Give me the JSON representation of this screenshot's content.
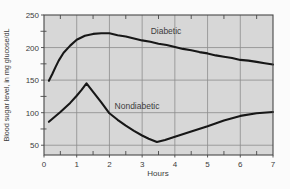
{
  "colors": {
    "outer_bg": "#fbfbfb",
    "plot_bg": "#d7d7d7",
    "grid": "#8d8d8d",
    "axis": "#474747",
    "curve": "#171717",
    "text": "#3c3c3c"
  },
  "chart_data": {
    "type": "line",
    "title": "",
    "xlabel": "Hours",
    "ylabel": "Blood sugar level, in mg glucose/dL",
    "xlim": [
      0,
      7
    ],
    "ylim": [
      35,
      250
    ],
    "x_ticks": [
      0,
      1,
      2,
      3,
      4,
      5,
      6,
      7
    ],
    "y_ticks": [
      50,
      100,
      150,
      200,
      250
    ],
    "x_minor_ticks": [
      0.5,
      1.5,
      2.5,
      3.5,
      4.5,
      5.5,
      6.5
    ],
    "y_minor_ticks": [
      75,
      125,
      175,
      225
    ],
    "grid": true,
    "legend_position": "inline-labels",
    "series": [
      {
        "name": "Diabetic",
        "points": [
          [
            0.15,
            149
          ],
          [
            0.25,
            159
          ],
          [
            0.35,
            170
          ],
          [
            0.45,
            180
          ],
          [
            0.6,
            192
          ],
          [
            0.8,
            203
          ],
          [
            1.0,
            212
          ],
          [
            1.25,
            218
          ],
          [
            1.5,
            221
          ],
          [
            1.75,
            222
          ],
          [
            2.0,
            222
          ],
          [
            2.25,
            219
          ],
          [
            2.5,
            217
          ],
          [
            2.75,
            214
          ],
          [
            3.0,
            211
          ],
          [
            3.25,
            209
          ],
          [
            3.5,
            206
          ],
          [
            3.75,
            204
          ],
          [
            4.0,
            201
          ],
          [
            4.25,
            198
          ],
          [
            4.5,
            196
          ],
          [
            4.75,
            193
          ],
          [
            5.0,
            191
          ],
          [
            5.25,
            188
          ],
          [
            5.5,
            186
          ],
          [
            5.75,
            184
          ],
          [
            6.0,
            181
          ],
          [
            6.25,
            180
          ],
          [
            6.5,
            178
          ],
          [
            6.75,
            176
          ],
          [
            7.0,
            174
          ]
        ]
      },
      {
        "name": "Nondiabetic",
        "points": [
          [
            0.15,
            86
          ],
          [
            0.5,
            101
          ],
          [
            0.8,
            115
          ],
          [
            1.0,
            126
          ],
          [
            1.15,
            135
          ],
          [
            1.3,
            145
          ],
          [
            1.5,
            132
          ],
          [
            1.75,
            116
          ],
          [
            2.0,
            99
          ],
          [
            2.25,
            89
          ],
          [
            2.5,
            80
          ],
          [
            2.75,
            72
          ],
          [
            3.0,
            65
          ],
          [
            3.2,
            60
          ],
          [
            3.45,
            55
          ],
          [
            3.7,
            58
          ],
          [
            4.0,
            63
          ],
          [
            4.5,
            71
          ],
          [
            5.0,
            79
          ],
          [
            5.5,
            88
          ],
          [
            6.0,
            95
          ],
          [
            6.5,
            99
          ],
          [
            7.0,
            101
          ]
        ]
      }
    ]
  }
}
